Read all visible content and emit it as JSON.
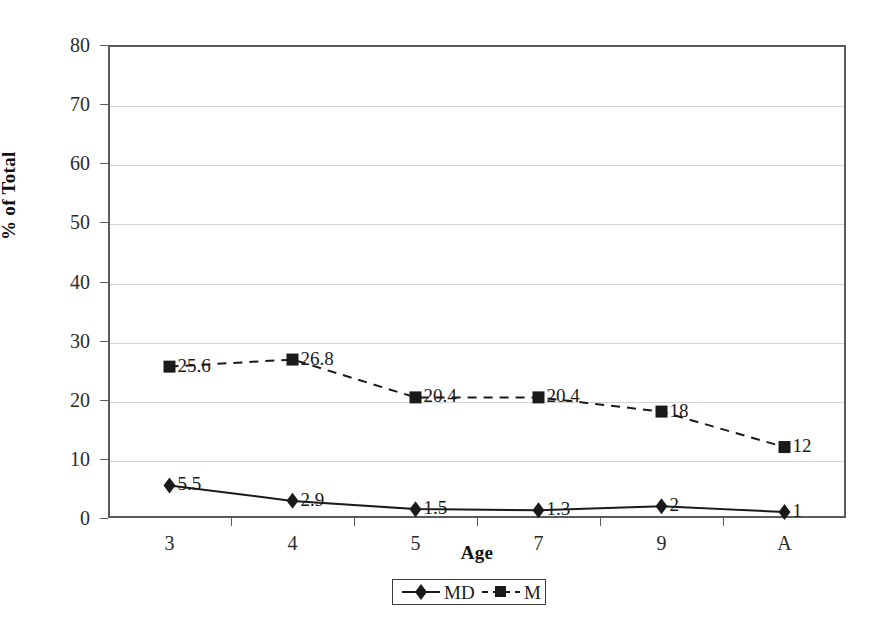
{
  "chart_data": {
    "type": "line",
    "title": "",
    "xlabel": "Age",
    "ylabel": "% of Total",
    "categories": [
      "3",
      "4",
      "5",
      "7",
      "9",
      "A"
    ],
    "ylim": [
      0,
      80
    ],
    "ytick_step": 10,
    "yticks": [
      "0",
      "10",
      "20",
      "30",
      "40",
      "50",
      "60",
      "70",
      "80"
    ],
    "grid": true,
    "legend_position": "bottom-center",
    "series": [
      {
        "name": "MD",
        "marker": "diamond",
        "linestyle": "solid",
        "color": "#1a1a1a",
        "values": [
          5.5,
          2.9,
          1.5,
          1.3,
          2,
          1
        ],
        "labels": [
          "5.5",
          "2.9",
          "1.5",
          "1.3",
          "2",
          "1"
        ]
      },
      {
        "name": "M",
        "marker": "square",
        "linestyle": "dashed",
        "color": "#1a1a1a",
        "values": [
          25.6,
          26.8,
          20.4,
          20.4,
          18,
          12
        ],
        "labels": [
          "25.6",
          "26.8",
          "20.4",
          "20.4",
          "18",
          "12"
        ]
      }
    ]
  },
  "style": {
    "axis_color": "#5b5b5b",
    "grid_color": "#d4d4d4",
    "text_color": "#1a1a1a",
    "background": "#ffffff"
  }
}
